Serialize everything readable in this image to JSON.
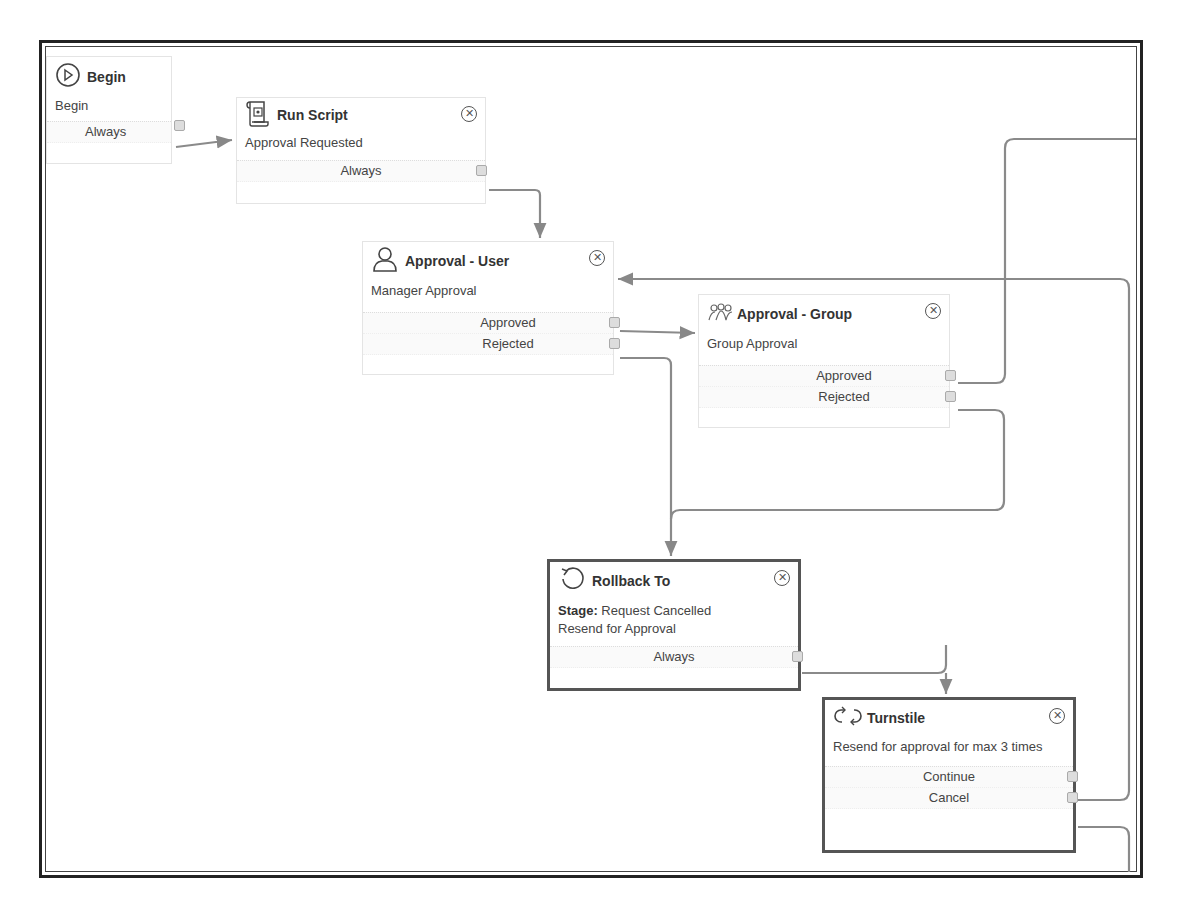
{
  "diagram": {
    "type": "workflow",
    "nodes": [
      {
        "id": "begin",
        "title": "Begin",
        "icon": "play-circle-icon",
        "description": "Begin",
        "outlets": [
          "Always"
        ],
        "closable": false,
        "selected": false
      },
      {
        "id": "run_script",
        "title": "Run Script",
        "icon": "script-scroll-icon",
        "description": "Approval Requested",
        "outlets": [
          "Always"
        ],
        "closable": true,
        "selected": false
      },
      {
        "id": "approval_user",
        "title": "Approval - User",
        "icon": "user-icon",
        "description": "Manager Approval",
        "outlets": [
          "Approved",
          "Rejected"
        ],
        "closable": true,
        "selected": false
      },
      {
        "id": "approval_group",
        "title": "Approval - Group",
        "icon": "group-icon",
        "description": "Group Approval",
        "outlets": [
          "Approved",
          "Rejected"
        ],
        "closable": true,
        "selected": false
      },
      {
        "id": "rollback_to",
        "title": "Rollback To",
        "icon": "rollback-icon",
        "description_label": "Stage:",
        "description_value": "Request Cancelled",
        "description_line2": "Resend for Approval",
        "outlets": [
          "Always"
        ],
        "closable": true,
        "selected": true
      },
      {
        "id": "turnstile",
        "title": "Turnstile",
        "icon": "turnstile-icon",
        "description": "Resend for approval for max 3 times",
        "outlets": [
          "Continue",
          "Cancel"
        ],
        "closable": true,
        "selected": true
      }
    ],
    "edges": [
      {
        "from": "begin",
        "outlet": "Always",
        "to": "run_script"
      },
      {
        "from": "run_script",
        "outlet": "Always",
        "to": "approval_user"
      },
      {
        "from": "approval_user",
        "outlet": "Approved",
        "to": "approval_group"
      },
      {
        "from": "approval_user",
        "outlet": "Rejected",
        "to": "rollback_to"
      },
      {
        "from": "approval_group",
        "outlet": "Approved",
        "to": "offscreen-right"
      },
      {
        "from": "approval_group",
        "outlet": "Rejected",
        "to": "rollback_to"
      },
      {
        "from": "rollback_to",
        "outlet": "Always",
        "to": "turnstile"
      },
      {
        "from": "turnstile",
        "outlet": "Continue",
        "to": "approval_user"
      },
      {
        "from": "turnstile",
        "outlet": "Cancel",
        "to": "offscreen-bottom"
      }
    ],
    "colors": {
      "connector": "#8a8a8a",
      "selected_border": "#555555",
      "frame": "#222222"
    }
  }
}
